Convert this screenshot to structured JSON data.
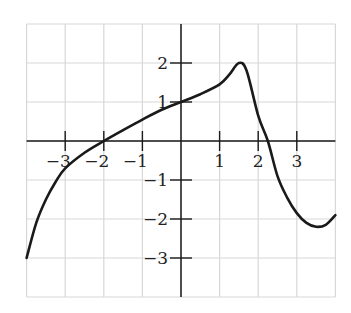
{
  "chart_data": {
    "type": "line",
    "title": "",
    "xlabel": "",
    "ylabel": "",
    "xlim": [
      -4,
      4
    ],
    "ylim": [
      -4,
      3
    ],
    "grid": true,
    "x_ticks": [
      -3,
      -2,
      -1,
      1,
      2,
      3
    ],
    "y_ticks": [
      -3,
      -2,
      -1,
      1,
      2
    ],
    "x_tick_labels": [
      "−3",
      "−2",
      "−1",
      "1",
      "2",
      "3"
    ],
    "y_tick_labels": [
      "−3",
      "−2",
      "−1",
      "1",
      "2"
    ],
    "series": [
      {
        "name": "f(x)",
        "x": [
          -4,
          -3.75,
          -3.5,
          -3.25,
          -3,
          -2.5,
          -2,
          -1.5,
          -1,
          -0.5,
          0,
          0.5,
          1,
          1.25,
          1.5,
          1.7,
          2,
          2.25,
          2.5,
          2.75,
          3,
          3.25,
          3.5,
          3.75,
          4
        ],
        "values": [
          -3,
          -2.1,
          -1.5,
          -1.05,
          -0.7,
          -0.3,
          0,
          0.28,
          0.55,
          0.8,
          1.0,
          1.2,
          1.45,
          1.7,
          2.0,
          1.8,
          0.65,
          0.0,
          -0.9,
          -1.45,
          -1.85,
          -2.1,
          -2.2,
          -2.15,
          -1.9
        ]
      }
    ],
    "colors": {
      "curve": "#1a1a1a",
      "axes": "#1a1a1a",
      "grid": "#d8d8d8"
    }
  }
}
